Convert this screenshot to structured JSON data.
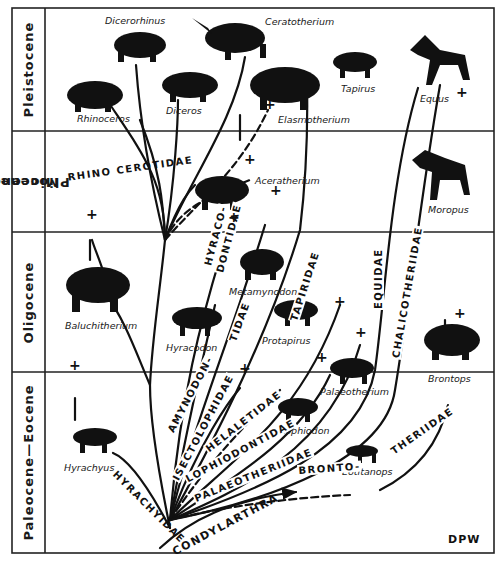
{
  "diagram": {
    "type": "phylogenetic-tree",
    "credit": "DPW",
    "colors": {
      "ink": "#111111",
      "background": "#ffffff"
    },
    "epochs": [
      {
        "id": "pleistocene",
        "label": "Pleistocene"
      },
      {
        "id": "miocene-pliocene",
        "label": "Miocene-\nPliocene",
        "line1": "Miocene-",
        "line2": "Pliocene"
      },
      {
        "id": "oligocene",
        "label": "Oligocene"
      },
      {
        "id": "paleocene-eocene",
        "label": "Paleocene—Eocene"
      }
    ],
    "root": "CONDYLARTHRA",
    "families": {
      "rhinocerotidae": "RHINO CEROTIDAE",
      "hyracodontidae_1": "HYRACO-",
      "hyracodontidae_2": "DONTIDAE",
      "amynodontidae_1": "AMYNODON-",
      "amynodontidae_2": "TIDAE",
      "isectolophidae": "ISECTOLOPHIDAE",
      "helaletidae": "HELALETIDAE",
      "lophiodontidae": "LOPHIODONTIDAE",
      "palaeotheriidae": "PALAEOTHERIIDAE",
      "tapiridae": "TAPIRIDAE",
      "equidae": "EQUIDAE",
      "chalicotheriidae": "CHALICOTHERIIDAE",
      "brontotheriidae_1": "BRONTO-",
      "brontotheriidae_2": "THERIIDAE",
      "hyrachyidae": "HYRACHYIDAE"
    },
    "genera": {
      "dicerorhinus": "Dicerorhinus",
      "ceratotherium": "Ceratotherium",
      "rhinoceros": "Rhinoceros",
      "diceros": "Diceros",
      "elasmotherium": "Elasmotherium",
      "tapirus": "Tapirus",
      "equus": "Equus",
      "aceratherium": "Aceratherium",
      "moropus": "Moropus",
      "baluchitherium": "Baluchitherium",
      "metamynodon": "Metamynodon",
      "hyracodon": "Hyracodon",
      "protapirus": "Protapirus",
      "palaeotherium": "Palaeotherium",
      "brontops": "Brontops",
      "lophiodon": "Lophiodon",
      "hyrachyus": "Hyrachyus",
      "eotitanops": "Eotitanops"
    },
    "extinction_marker": "+"
  }
}
